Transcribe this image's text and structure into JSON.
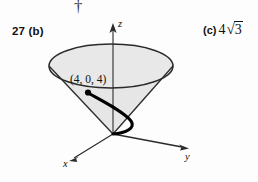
{
  "page": {
    "marginal_mark": "†",
    "background_color": "#fdfdfd"
  },
  "problem": {
    "number_part": "27 (b)",
    "answer_part": "(c)",
    "answer_value": "4",
    "answer_radicand": "3"
  },
  "figure": {
    "name": "cone-with-spiral-curve",
    "point_label": "(4, 0, 4)",
    "axes": {
      "z": "z",
      "x": "x",
      "y": "y"
    },
    "colors": {
      "cone_fill": "#e6e6e6",
      "outline": "#2a2a2a",
      "curve": "#000000",
      "axis": "#3a3a3a"
    }
  }
}
